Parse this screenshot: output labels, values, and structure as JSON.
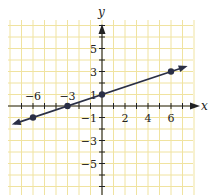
{
  "chart_data": {
    "type": "line",
    "title": "",
    "xlabel": "x",
    "ylabel": "y",
    "xlim": [
      -8,
      8
    ],
    "ylim": [
      -7.5,
      7.5
    ],
    "grid": true,
    "grid_color": "#f0e3a0",
    "line_color": "#2a2f45",
    "x_ticks": [
      -6,
      -3,
      2,
      4,
      6
    ],
    "y_ticks": [
      5,
      3,
      1,
      -1,
      -3,
      -5
    ],
    "x_tick_labels": [
      "−6",
      "−3",
      "2",
      "4",
      "6"
    ],
    "y_tick_labels": [
      "5",
      "3",
      "1",
      "−1",
      "−3",
      "−5"
    ],
    "series": [
      {
        "name": "y = x/3 + 1",
        "equation": "y = (1/3)x + 1",
        "slope": 0.3333,
        "intercept": 1,
        "points": [
          {
            "x": -6,
            "y": -1
          },
          {
            "x": -3,
            "y": 0
          },
          {
            "x": 0,
            "y": 1
          },
          {
            "x": 6,
            "y": 3
          }
        ],
        "arrows_both_ends": true
      }
    ]
  }
}
